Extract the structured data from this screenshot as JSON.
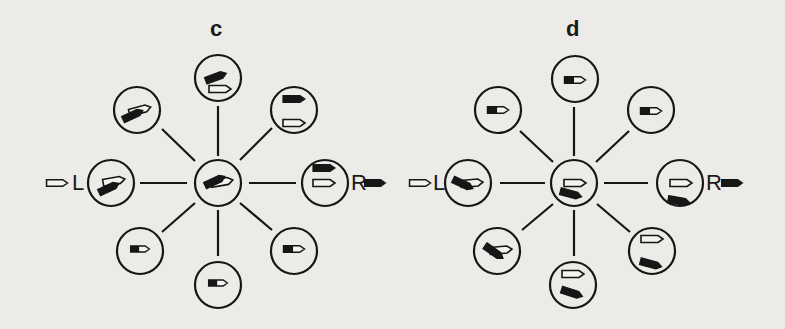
{
  "panels": [
    {
      "id": "c",
      "label": "c",
      "left_label": "L",
      "right_label": "R",
      "center": {
        "x": 218,
        "y": 183
      },
      "left_arrow": "hollow",
      "right_arrow": "filled",
      "nodes": [
        {
          "pos": "top",
          "x": 218,
          "y": 78,
          "desc": "tilted black bar above hollow pointer"
        },
        {
          "pos": "top-left",
          "x": 137,
          "y": 110,
          "desc": "black bar overlapping hollow pointer, tilted"
        },
        {
          "pos": "top-right",
          "x": 294,
          "y": 110,
          "desc": "black pointer above hollow pointer"
        },
        {
          "pos": "left",
          "x": 111,
          "y": 183,
          "desc": "tilted black bar under hollow pointer"
        },
        {
          "pos": "center",
          "x": 218,
          "y": 183,
          "desc": "black and hollow pointers overlapping, tilted"
        },
        {
          "pos": "right",
          "x": 325,
          "y": 183,
          "desc": "black pointer above hollow pointer"
        },
        {
          "pos": "bottom-left",
          "x": 140,
          "y": 251,
          "desc": "black bar joined to hollow pointer"
        },
        {
          "pos": "bottom",
          "x": 218,
          "y": 285,
          "desc": "black bar joined to hollow pointer"
        },
        {
          "pos": "bottom-right",
          "x": 294,
          "y": 251,
          "desc": "black bar joined to hollow pointer"
        }
      ]
    },
    {
      "id": "d",
      "label": "d",
      "left_label": "L",
      "right_label": "R",
      "center": {
        "x": 574,
        "y": 183
      },
      "left_arrow": "hollow",
      "right_arrow": "filled",
      "nodes": [
        {
          "pos": "top",
          "x": 575,
          "y": 79,
          "desc": "black bar joined to hollow pointer"
        },
        {
          "pos": "top-left",
          "x": 498,
          "y": 110,
          "desc": "black bar joined to hollow pointer"
        },
        {
          "pos": "top-right",
          "x": 651,
          "y": 110,
          "desc": "black bar joined to hollow pointer"
        },
        {
          "pos": "left",
          "x": 468,
          "y": 183,
          "desc": "black bar tilted down across hollow pointer"
        },
        {
          "pos": "center",
          "x": 574,
          "y": 183,
          "desc": "hollow pointer above tilted black bar"
        },
        {
          "pos": "right",
          "x": 680,
          "y": 183,
          "desc": "hollow pointer above black bar at bottom"
        },
        {
          "pos": "bottom-left",
          "x": 497,
          "y": 251,
          "desc": "crossed black bar with hollow pointer"
        },
        {
          "pos": "bottom",
          "x": 573,
          "y": 285,
          "desc": "hollow pointer above tilted black bar"
        },
        {
          "pos": "bottom-right",
          "x": 652,
          "y": 251,
          "desc": "hollow pointer above black bar at bottom"
        }
      ]
    }
  ],
  "colors": {
    "ink": "#161616",
    "paper": "#ecebe7"
  }
}
